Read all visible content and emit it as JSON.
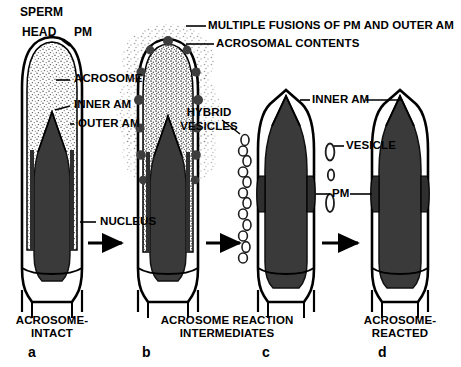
{
  "figure": {
    "title_semantic": "acrosome-reaction-stages-diagram",
    "background": "#ffffff",
    "ink": "#000000",
    "nucleus_fill": "#3a3a3a"
  },
  "labels": {
    "sperm": "SPERM",
    "head": "HEAD",
    "pm_top": "PM",
    "acrosome": "ACROSOME",
    "inner_am_left": "INNER AM",
    "outer_am_left": "OUTER AM",
    "nucleus": "NUCLEUS",
    "multiple_fusions": "MULTIPLE FUSIONS OF PM AND OUTER AM",
    "acrosomal_contents": "ACROSOMAL CONTENTS",
    "hybrid_vesicles_line1": "HYBRID",
    "hybrid_vesicles_line2": "VESICLES",
    "inner_am_right": "INNER AM",
    "vesicle": "VESICLE",
    "pm_right": "PM"
  },
  "captions": {
    "a_line1": "ACROSOME-",
    "a_line2": "INTACT",
    "bc_line1": "ACROSOME REACTION",
    "bc_line2": "INTERMEDIATES",
    "d_line1": "ACROSOME-",
    "d_line2": "REACTED"
  },
  "panel_letters": {
    "a": "a",
    "b": "b",
    "c": "c",
    "d": "d"
  }
}
